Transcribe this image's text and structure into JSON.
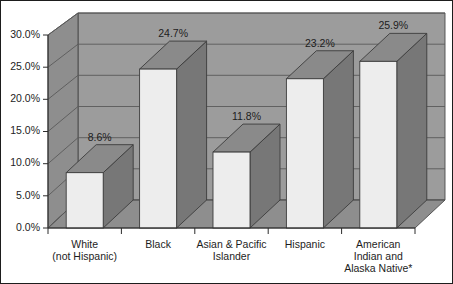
{
  "chart_data": {
    "type": "bar",
    "title": "",
    "subtitle": "",
    "xlabel": "",
    "ylabel": "",
    "categories": [
      "White\n(not Hispanic)",
      "Black",
      "Asian & Pacific\nIslander",
      "Hispanic",
      "American\nIndian and\nAlaska Native*"
    ],
    "category_lines": [
      [
        "White",
        "(not Hispanic)"
      ],
      [
        "Black"
      ],
      [
        "Asian & Pacific",
        "Islander"
      ],
      [
        "Hispanic"
      ],
      [
        "American",
        "Indian and",
        "Alaska Native*"
      ]
    ],
    "values": [
      8.6,
      24.7,
      11.8,
      23.2,
      25.9
    ],
    "value_labels": [
      "8.6%",
      "24.7%",
      "11.8%",
      "23.2%",
      "25.9%"
    ],
    "ylim": [
      0,
      30
    ],
    "ytick_values": [
      0,
      5,
      10,
      15,
      20,
      25,
      30
    ],
    "ytick_labels": [
      "0.0%",
      "5.0%",
      "10.0%",
      "15.0%",
      "20.0%",
      "25.0%",
      "30.0%"
    ],
    "grid": true,
    "legend": null,
    "legend_position": "none",
    "three_d": true
  },
  "style": {
    "page_background": "#ffffff",
    "plot_wall_back": "#9c9c9c",
    "plot_wall_side": "#8e8e8e",
    "plot_floor": "#8e8e8e",
    "bar_front": "#ededed",
    "bar_top": "#8a8a8a",
    "bar_side": "#777777",
    "gridline": "#5a5a5a",
    "axis": "#2c2c2c",
    "text": "#1d1d1d",
    "frame_border": "#1d1d1d"
  }
}
